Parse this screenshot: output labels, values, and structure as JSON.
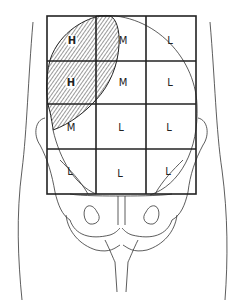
{
  "diagram": {
    "grid": {
      "columns": 3,
      "rows": 4,
      "cells": [
        [
          "H",
          "M",
          "L"
        ],
        [
          "H",
          "M",
          "L"
        ],
        [
          "M",
          "L",
          "L"
        ],
        [
          "L",
          "L",
          "L"
        ]
      ],
      "circled_labels": [
        "H"
      ]
    },
    "labels": {
      "r0c0": "H",
      "r0c1": "M",
      "r0c2": "L",
      "r1c0": "H",
      "r1c1": "M",
      "r1c2": "L",
      "r2c0": "M",
      "r2c1": "L",
      "r2c2": "L",
      "r3c0": "L",
      "r3c1": "L",
      "r3c2": "L"
    },
    "colors": {
      "line": "#222222",
      "hatch": "#555555",
      "background": "#ffffff"
    }
  }
}
